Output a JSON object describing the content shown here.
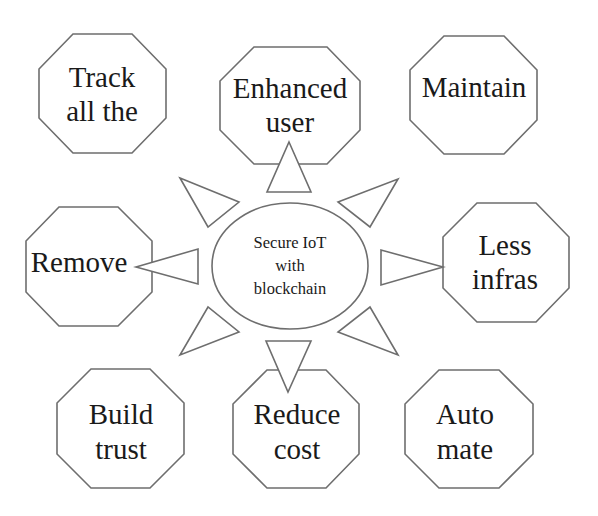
{
  "diagram": {
    "type": "radial-concept-map",
    "colors": {
      "background": "#ffffff",
      "stroke": "#6e6e6e",
      "text": "#1a1a1a"
    },
    "center": {
      "shape": "ellipse",
      "lines": [
        "Secure IoT",
        "with",
        "blockchain"
      ]
    },
    "nodes": [
      {
        "id": "track",
        "shape": "octagon",
        "lines": [
          "Track",
          "all the"
        ]
      },
      {
        "id": "enhanced",
        "shape": "octagon",
        "lines": [
          "Enhanced",
          "user"
        ]
      },
      {
        "id": "maintain",
        "shape": "octagon",
        "lines": [
          "Maintain"
        ]
      },
      {
        "id": "remove",
        "shape": "octagon",
        "lines": [
          "Remove"
        ]
      },
      {
        "id": "less-infras",
        "shape": "octagon",
        "lines": [
          "Less",
          "infras"
        ]
      },
      {
        "id": "build-trust",
        "shape": "octagon",
        "lines": [
          "Build",
          "trust"
        ]
      },
      {
        "id": "reduce-cost",
        "shape": "octagon",
        "lines": [
          "Reduce",
          "cost"
        ]
      },
      {
        "id": "automate",
        "shape": "octagon",
        "lines": [
          "Auto",
          "mate"
        ]
      }
    ],
    "connectors": [
      {
        "id": "up",
        "shape": "triangle-arrow",
        "direction": "up"
      },
      {
        "id": "up-left",
        "shape": "triangle-arrow",
        "direction": "up-left"
      },
      {
        "id": "up-right",
        "shape": "triangle-arrow",
        "direction": "up-right"
      },
      {
        "id": "left",
        "shape": "triangle-arrow",
        "direction": "left"
      },
      {
        "id": "right",
        "shape": "triangle-arrow",
        "direction": "right"
      },
      {
        "id": "down-left",
        "shape": "triangle-arrow",
        "direction": "down-left"
      },
      {
        "id": "down-right",
        "shape": "triangle-arrow",
        "direction": "down-right"
      },
      {
        "id": "down",
        "shape": "triangle-arrow",
        "direction": "down"
      }
    ]
  }
}
